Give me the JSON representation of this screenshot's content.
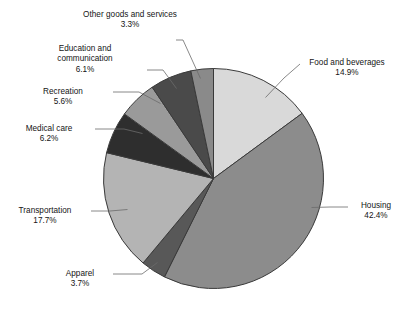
{
  "chart_data": {
    "type": "pie",
    "title": "",
    "subtitle": "",
    "xlabel": "",
    "ylabel": "",
    "legend_position": "none",
    "grid": false,
    "unit": "%",
    "start_angle_deg": 0,
    "direction": "clockwise",
    "categories": [
      "Food and beverages",
      "Housing",
      "Apparel",
      "Transportation",
      "Medical care",
      "Recreation",
      "Education and communication",
      "Other goods and services"
    ],
    "values": [
      14.9,
      42.4,
      3.7,
      17.7,
      6.2,
      5.6,
      6.1,
      3.3
    ],
    "slices": [
      {
        "label": "Food and beverages",
        "label_line1": "Food and beverages",
        "label_line2": "",
        "value": 14.9,
        "value_text": "14.9%",
        "color": "#d9d9d9"
      },
      {
        "label": "Housing",
        "label_line1": "Housing",
        "label_line2": "",
        "value": 42.4,
        "value_text": "42.4%",
        "color": "#8c8c8c"
      },
      {
        "label": "Apparel",
        "label_line1": "Apparel",
        "label_line2": "",
        "value": 3.7,
        "value_text": "3.7%",
        "color": "#585858"
      },
      {
        "label": "Transportation",
        "label_line1": "Transportation",
        "label_line2": "",
        "value": 17.7,
        "value_text": "17.7%",
        "color": "#b4b4b4"
      },
      {
        "label": "Medical care",
        "label_line1": "Medical care",
        "label_line2": "",
        "value": 6.2,
        "value_text": "6.2%",
        "color": "#2e2e2e"
      },
      {
        "label": "Recreation",
        "label_line1": "Recreation",
        "label_line2": "",
        "value": 5.6,
        "value_text": "5.6%",
        "color": "#9a9a9a"
      },
      {
        "label": "Education and communication",
        "label_line1": "Education and",
        "label_line2": "communication",
        "value": 6.1,
        "value_text": "6.1%",
        "color": "#4a4a4a"
      },
      {
        "label": "Other goods and services",
        "label_line1": "Other goods and services",
        "label_line2": "",
        "value": 3.3,
        "value_text": "3.3%",
        "color": "#8a8a8a"
      }
    ]
  },
  "colors": {
    "background": "#ffffff",
    "text": "#141414",
    "slice_outline": "#3a3a3a",
    "leader_line": "#6b6b6b"
  }
}
